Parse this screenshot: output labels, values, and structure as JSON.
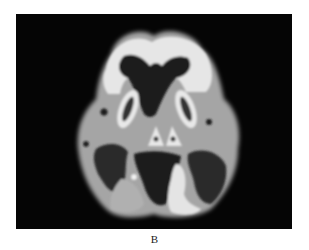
{
  "figure": {
    "panel_label": "B",
    "image_description": "Axial grayscale brain scan (PET/MRI-like) on black background",
    "colors": {
      "background": "#050505",
      "white_matter": "#e8e8e8",
      "gray_matter": "#a8a8a8",
      "csf_dark": "#1c1c1c"
    }
  }
}
